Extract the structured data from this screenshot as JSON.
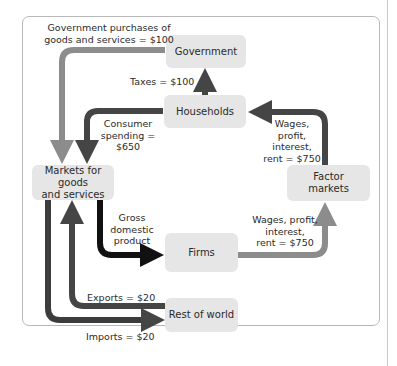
{
  "diagram": {
    "nodes": {
      "government": "Government",
      "households": "Households",
      "markets_goods": "Markets for goods\nand services",
      "factor_markets": "Factor\nmarkets",
      "firms": "Firms",
      "rest_of_world": "Rest of world"
    },
    "flows": {
      "gov_purchases": "Government purchases of\ngoods and services = $100",
      "taxes": "Taxes = $100",
      "consumer_spending": "Consumer\nspending = $650",
      "wages_to_households": "Wages,\nprofit,\ninterest,\nrent = $750",
      "gdp": "Gross\ndomestic\nproduct",
      "wages_from_firms": "Wages, profit,\ninterest,\nrent = $750",
      "exports": "Exports = $20",
      "imports": "Imports = $20"
    },
    "colors": {
      "box_fill": "#e6e6e6",
      "light_flow": "#8c8c8c",
      "dark_flow": "#454545",
      "black_flow": "#111111",
      "frame": "#b8b8b8"
    }
  }
}
